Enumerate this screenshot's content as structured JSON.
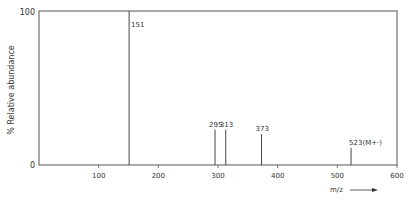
{
  "chart_data": {
    "type": "bar",
    "title": "",
    "xlabel": "m/z",
    "ylabel": "% Relative abundance",
    "xlim": [
      0,
      600
    ],
    "ylim": [
      0,
      100
    ],
    "x_ticks": [
      100,
      200,
      300,
      400,
      500,
      600
    ],
    "y_ticks": [
      0,
      100
    ],
    "grid": false,
    "peaks": [
      {
        "mz": 151,
        "abundance": 100,
        "label": "151"
      },
      {
        "mz": 295,
        "abundance": 23,
        "label": "295"
      },
      {
        "mz": 313,
        "abundance": 23,
        "label": "313"
      },
      {
        "mz": 373,
        "abundance": 20,
        "label": "373"
      },
      {
        "mz": 523,
        "abundance": 11,
        "label": "523(M+·)"
      }
    ]
  },
  "labels": {
    "y_top": "100",
    "y_bottom": "0",
    "ylabel": "% Relative abundance",
    "xlabel": "m/z"
  }
}
